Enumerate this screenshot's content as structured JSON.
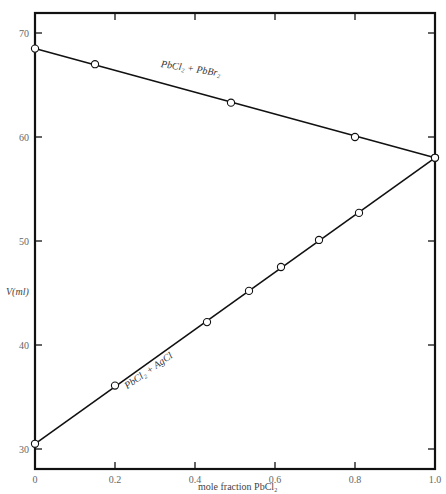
{
  "chart_data": {
    "type": "line",
    "title": "",
    "xlabel": "mole fraction PbCl₂",
    "ylabel": "V(ml)",
    "xlim": [
      0,
      1.0
    ],
    "ylim": [
      28,
      72
    ],
    "x_ticks": [
      "0",
      "0.2",
      "0.4",
      "0.6",
      "0.8",
      "1.0"
    ],
    "y_ticks": [
      "30",
      "40",
      "50",
      "60",
      "70"
    ],
    "grid": false,
    "legend": "none (inline line labels)",
    "series": [
      {
        "name": "PbCl₂ + PbBr₂",
        "x": [
          0,
          0.15,
          0.49,
          0.8,
          1.0
        ],
        "y": [
          68.5,
          67.0,
          63.3,
          60.0,
          58.0
        ]
      },
      {
        "name": "PbCl₂ + AgCl",
        "x": [
          0,
          0.2,
          0.43,
          0.535,
          0.615,
          0.71,
          0.81,
          1.0
        ],
        "y": [
          30.5,
          36.1,
          42.2,
          45.2,
          47.5,
          50.1,
          52.7,
          58.0
        ]
      }
    ],
    "annotations": [
      "PbCl₂ + PbBr₂",
      "PbCl₂ + AgCl"
    ]
  },
  "labels": {
    "xlabel": "mole fraction PbCl₂",
    "ylabel": "V(ml)",
    "series1": "PbCl₂ + PbBr₂",
    "series2": "PbCl₂ + AgCl"
  }
}
